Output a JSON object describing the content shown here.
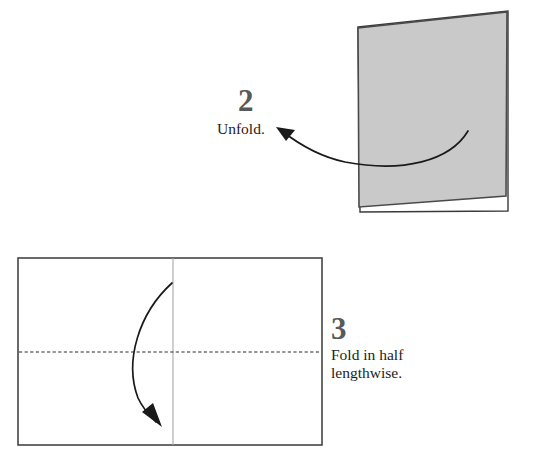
{
  "document": {
    "title": "Origami folding instructions",
    "type": "instructional-diagram"
  },
  "colors": {
    "paper_fill": "#c9c9c9",
    "paper_stroke": "#4a4a4a",
    "outline": "#3a3a3a",
    "crease_line": "#a8a8a8",
    "fold_dash": "#2b2b2b",
    "arrow": "#1a1a1a",
    "number_text": "#58595b",
    "caption_text": "#1d1d1b",
    "background": "#ffffff"
  },
  "steps": [
    {
      "id": "step-2",
      "number": "2",
      "caption": "Unfold.",
      "illustration": "gray-quadrilateral-sheet",
      "arrow": {
        "name": "unfold-arrow",
        "direction": "right-to-left",
        "style": "curved-solid",
        "head": "filled-triangle"
      }
    },
    {
      "id": "step-3",
      "number": "3",
      "caption": "Fold in half\nlengthwise.",
      "illustration": "unfolded-rectangle-with-creases",
      "arrow": {
        "name": "fold-arrow",
        "direction": "downward",
        "style": "curved-solid",
        "head": "filled-triangle"
      },
      "lines": {
        "vertical_crease": "existing-center-crease",
        "horizontal_dashed": "new-fold-line"
      }
    }
  ],
  "geometry": {
    "step2_sheet_points": "358,27 508,11 508,211 360,211",
    "step2_sheet_front": "358,27 508,11 507,196 359,206",
    "step2_arrow_path": "M 468 131 C 449 160 404 172 346 162 C 318 157 296 142 281 131",
    "step2_arrow_head": "277,128 294,131 287,140",
    "step3_rect": {
      "x": 18,
      "y": 258,
      "width": 304,
      "height": 187
    },
    "step3_vertical_crease_x": 173,
    "step3_dashed_y": 352,
    "step3_arrow_path": "M 172 283 C 140 312 125 360 138 398 C 144 409 150 416 156 421",
    "step3_arrow_head": "161,425 144,411 154,404"
  }
}
